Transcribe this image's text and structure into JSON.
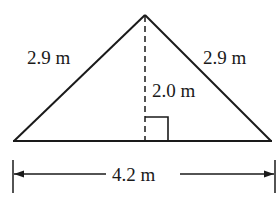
{
  "diagram": {
    "type": "isosceles-triangle-with-height",
    "labels": {
      "left_side": "2.9 m",
      "right_side": "2.9 m",
      "height": "2.0 m",
      "base": "4.2 m"
    },
    "colors": {
      "stroke": "#1a1a1a",
      "background": "#ffffff"
    }
  }
}
